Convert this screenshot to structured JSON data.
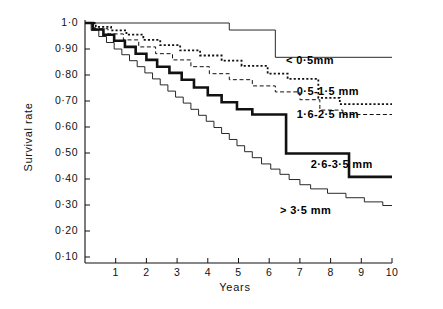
{
  "chart_data": {
    "type": "line",
    "title": "",
    "xlabel": "Years",
    "ylabel": "Survival rate",
    "xlim": [
      0,
      10
    ],
    "ylim": [
      0.05,
      1.0
    ],
    "grid": false,
    "legend_position": "inline-right",
    "x_ticks": [
      "1",
      "2",
      "3",
      "4",
      "5",
      "6",
      "7",
      "8",
      "9",
      "10"
    ],
    "x_tick_values": [
      1,
      2,
      3,
      4,
      5,
      6,
      7,
      8,
      9,
      10
    ],
    "y_ticks": [
      "1·0",
      "0·90",
      "0·80",
      "0·70",
      "0·60",
      "0·50",
      "0·40",
      "0·30",
      "0·20",
      "0·10"
    ],
    "y_tick_values": [
      1.0,
      0.9,
      0.8,
      0.7,
      0.6,
      0.5,
      0.4,
      0.3,
      0.2,
      0.1
    ],
    "series": [
      {
        "name": "< 0·5mm",
        "style": "thin-solid",
        "label_x": 6.55,
        "label_y": 0.855,
        "steps": [
          [
            0.0,
            1.0
          ],
          [
            4.7,
            1.0
          ],
          [
            4.7,
            0.973
          ],
          [
            6.2,
            0.973
          ],
          [
            6.2,
            0.868
          ],
          [
            10.0,
            0.868
          ]
        ]
      },
      {
        "name": "0·5-1·5 mm",
        "style": "dotted",
        "label_x": 6.9,
        "label_y": 0.735,
        "steps": [
          [
            0.0,
            1.0
          ],
          [
            0.35,
            1.0
          ],
          [
            0.35,
            0.985
          ],
          [
            0.85,
            0.985
          ],
          [
            0.85,
            0.972
          ],
          [
            1.35,
            0.972
          ],
          [
            1.35,
            0.955
          ],
          [
            1.9,
            0.955
          ],
          [
            1.9,
            0.935
          ],
          [
            2.45,
            0.935
          ],
          [
            2.45,
            0.915
          ],
          [
            3.1,
            0.915
          ],
          [
            3.1,
            0.895
          ],
          [
            3.75,
            0.895
          ],
          [
            3.75,
            0.875
          ],
          [
            4.45,
            0.875
          ],
          [
            4.45,
            0.855
          ],
          [
            5.1,
            0.855
          ],
          [
            5.1,
            0.835
          ],
          [
            5.95,
            0.835
          ],
          [
            5.95,
            0.805
          ],
          [
            6.6,
            0.805
          ],
          [
            6.6,
            0.785
          ],
          [
            7.6,
            0.785
          ],
          [
            7.6,
            0.712
          ],
          [
            8.3,
            0.712
          ],
          [
            8.3,
            0.688
          ],
          [
            10.0,
            0.688
          ]
        ]
      },
      {
        "name": "1·6-2·5 mm",
        "style": "dashed",
        "label_x": 6.9,
        "label_y": 0.648,
        "steps": [
          [
            0.0,
            1.0
          ],
          [
            0.3,
            1.0
          ],
          [
            0.3,
            0.978
          ],
          [
            0.75,
            0.978
          ],
          [
            0.75,
            0.958
          ],
          [
            1.25,
            0.958
          ],
          [
            1.25,
            0.935
          ],
          [
            1.75,
            0.935
          ],
          [
            1.75,
            0.908
          ],
          [
            2.3,
            0.908
          ],
          [
            2.3,
            0.882
          ],
          [
            2.85,
            0.882
          ],
          [
            2.85,
            0.858
          ],
          [
            3.45,
            0.858
          ],
          [
            3.45,
            0.832
          ],
          [
            4.05,
            0.832
          ],
          [
            4.05,
            0.805
          ],
          [
            4.7,
            0.805
          ],
          [
            4.7,
            0.782
          ],
          [
            5.45,
            0.782
          ],
          [
            5.45,
            0.758
          ],
          [
            6.2,
            0.758
          ],
          [
            6.2,
            0.735
          ],
          [
            7.0,
            0.735
          ],
          [
            7.0,
            0.705
          ],
          [
            7.65,
            0.705
          ],
          [
            7.65,
            0.665
          ],
          [
            8.4,
            0.665
          ],
          [
            8.4,
            0.648
          ],
          [
            10.0,
            0.648
          ]
        ]
      },
      {
        "name": "2·6-3·5 mm",
        "style": "bold-solid",
        "label_x": 7.35,
        "label_y": 0.455,
        "steps": [
          [
            0.0,
            1.0
          ],
          [
            0.25,
            1.0
          ],
          [
            0.25,
            0.975
          ],
          [
            0.6,
            0.975
          ],
          [
            0.6,
            0.955
          ],
          [
            0.95,
            0.955
          ],
          [
            0.95,
            0.932
          ],
          [
            1.3,
            0.932
          ],
          [
            1.3,
            0.908
          ],
          [
            1.65,
            0.908
          ],
          [
            1.65,
            0.882
          ],
          [
            2.0,
            0.882
          ],
          [
            2.0,
            0.858
          ],
          [
            2.35,
            0.858
          ],
          [
            2.35,
            0.832
          ],
          [
            2.75,
            0.832
          ],
          [
            2.75,
            0.808
          ],
          [
            3.15,
            0.808
          ],
          [
            3.15,
            0.782
          ],
          [
            3.55,
            0.782
          ],
          [
            3.55,
            0.752
          ],
          [
            4.0,
            0.752
          ],
          [
            4.0,
            0.722
          ],
          [
            4.45,
            0.722
          ],
          [
            4.45,
            0.695
          ],
          [
            4.95,
            0.695
          ],
          [
            4.95,
            0.668
          ],
          [
            5.45,
            0.668
          ],
          [
            5.45,
            0.648
          ],
          [
            6.55,
            0.648
          ],
          [
            6.55,
            0.498
          ],
          [
            8.6,
            0.498
          ],
          [
            8.6,
            0.408
          ],
          [
            10.0,
            0.408
          ]
        ]
      },
      {
        "name": "> 3·5 mm",
        "style": "thin-solid",
        "label_x": 6.35,
        "label_y": 0.278,
        "steps": [
          [
            0.0,
            1.0
          ],
          [
            0.2,
            1.0
          ],
          [
            0.2,
            0.972
          ],
          [
            0.45,
            0.972
          ],
          [
            0.45,
            0.948
          ],
          [
            0.7,
            0.948
          ],
          [
            0.7,
            0.925
          ],
          [
            0.95,
            0.925
          ],
          [
            0.95,
            0.9
          ],
          [
            1.2,
            0.9
          ],
          [
            1.2,
            0.878
          ],
          [
            1.45,
            0.878
          ],
          [
            1.45,
            0.855
          ],
          [
            1.7,
            0.855
          ],
          [
            1.7,
            0.832
          ],
          [
            1.95,
            0.832
          ],
          [
            1.95,
            0.808
          ],
          [
            2.2,
            0.808
          ],
          [
            2.2,
            0.785
          ],
          [
            2.45,
            0.785
          ],
          [
            2.45,
            0.762
          ],
          [
            2.7,
            0.762
          ],
          [
            2.7,
            0.738
          ],
          [
            2.95,
            0.738
          ],
          [
            2.95,
            0.715
          ],
          [
            3.2,
            0.715
          ],
          [
            3.2,
            0.692
          ],
          [
            3.45,
            0.692
          ],
          [
            3.45,
            0.668
          ],
          [
            3.7,
            0.668
          ],
          [
            3.7,
            0.645
          ],
          [
            3.95,
            0.645
          ],
          [
            3.95,
            0.622
          ],
          [
            4.2,
            0.622
          ],
          [
            4.2,
            0.598
          ],
          [
            4.45,
            0.598
          ],
          [
            4.45,
            0.575
          ],
          [
            4.7,
            0.575
          ],
          [
            4.7,
            0.552
          ],
          [
            4.95,
            0.552
          ],
          [
            4.95,
            0.528
          ],
          [
            5.2,
            0.528
          ],
          [
            5.2,
            0.505
          ],
          [
            5.45,
            0.505
          ],
          [
            5.45,
            0.482
          ],
          [
            5.75,
            0.482
          ],
          [
            5.75,
            0.458
          ],
          [
            6.05,
            0.458
          ],
          [
            6.05,
            0.438
          ],
          [
            6.35,
            0.438
          ],
          [
            6.35,
            0.418
          ],
          [
            6.65,
            0.418
          ],
          [
            6.65,
            0.398
          ],
          [
            7.0,
            0.398
          ],
          [
            7.0,
            0.378
          ],
          [
            7.35,
            0.378
          ],
          [
            7.35,
            0.362
          ],
          [
            7.9,
            0.362
          ],
          [
            7.9,
            0.345
          ],
          [
            8.5,
            0.345
          ],
          [
            8.5,
            0.328
          ],
          [
            9.1,
            0.328
          ],
          [
            9.1,
            0.312
          ],
          [
            9.7,
            0.312
          ],
          [
            9.7,
            0.298
          ],
          [
            10.0,
            0.298
          ]
        ]
      }
    ]
  },
  "axes": {
    "x_title": "Years",
    "y_title": "Survival rate"
  }
}
